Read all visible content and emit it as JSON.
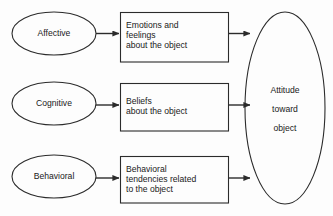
{
  "diagram": {
    "stroke_color": "#2b2b2b",
    "background_color": "#fdfdfd",
    "components": [
      {
        "label": "Affective"
      },
      {
        "label": "Cognitive"
      },
      {
        "label": "Behavioral"
      }
    ],
    "descriptions": [
      {
        "text": "Emotions and\nfeelings\nabout the object"
      },
      {
        "text": "Beliefs\nabout the object"
      },
      {
        "text": "Behavioral\ntendencies related\nto the object"
      }
    ],
    "outcome": {
      "line1": "Attitude",
      "line2": "toward",
      "line3": "object"
    },
    "arrows": [
      {
        "from": "Affective",
        "to": "Emotions and feelings about the object"
      },
      {
        "from": "Cognitive",
        "to": "Beliefs about the object"
      },
      {
        "from": "Behavioral",
        "to": "Behavioral tendencies related to the object"
      },
      {
        "from": "Emotions and feelings about the object",
        "to": "Attitude toward object"
      },
      {
        "from": "Beliefs about the object",
        "to": "Attitude toward object"
      },
      {
        "from": "Behavioral tendencies related to the object",
        "to": "Attitude toward object"
      }
    ]
  }
}
